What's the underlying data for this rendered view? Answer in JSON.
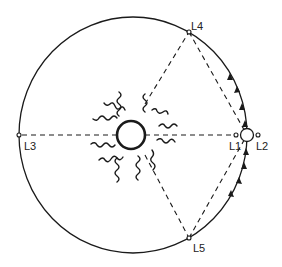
{
  "diagram": {
    "type": "lagrange-points",
    "orbit": {
      "cx": 133,
      "cy": 135,
      "rx": 114,
      "ry": 118
    },
    "sun": {
      "cx": 131,
      "cy": 135,
      "r": 14
    },
    "earth": {
      "cx": 247,
      "cy": 135,
      "r": 8
    },
    "points": [
      {
        "id": "L1",
        "label": "L1",
        "x": 236,
        "y": 135,
        "lx": 229,
        "ly": 150
      },
      {
        "id": "L2",
        "label": "L2",
        "x": 258,
        "y": 135,
        "lx": 256,
        "ly": 150
      },
      {
        "id": "L3",
        "label": "L3",
        "x": 19,
        "y": 135,
        "lx": 24,
        "ly": 150
      },
      {
        "id": "L4",
        "label": "L4",
        "x": 189,
        "y": 32,
        "lx": 191,
        "ly": 30
      },
      {
        "id": "L5",
        "label": "L5",
        "x": 189,
        "y": 238,
        "lx": 193,
        "ly": 252
      }
    ],
    "colors": {
      "line": "#1a1a1a",
      "background": "#ffffff"
    }
  }
}
